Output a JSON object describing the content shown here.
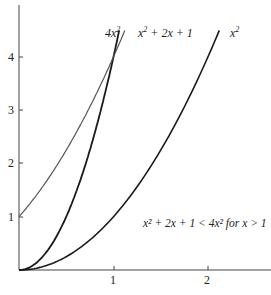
{
  "chart_data": {
    "type": "line",
    "title": "",
    "xlabel": "",
    "ylabel": "",
    "xlim": [
      0,
      2.65
    ],
    "ylim": [
      0,
      5
    ],
    "x_ticks": [
      1,
      2
    ],
    "y_ticks": [
      1,
      2,
      3,
      4
    ],
    "x_tick_labels": [
      "1",
      "2"
    ],
    "y_tick_labels": [
      "1",
      "2",
      "3",
      "4"
    ],
    "grid": false,
    "series": [
      {
        "name": "4x^2",
        "label": "4x²",
        "formula": "4*x^2",
        "x_range": [
          0,
          1.06
        ],
        "color": "#1a1a1a",
        "width": 1.8
      },
      {
        "name": "x^2+2x+1",
        "label": "x² + 2x + 1",
        "formula": "x^2+2x+1",
        "x_range": [
          0,
          1.12
        ],
        "color": "#555555",
        "width": 1.2
      },
      {
        "name": "x^2",
        "label": "x²",
        "formula": "x^2",
        "x_range": [
          0,
          2.12
        ],
        "color": "#1a1a1a",
        "width": 1.6
      }
    ],
    "annotations": [
      {
        "text": "x² + 2x + 1 < 4x² for x > 1",
        "x": 1.32,
        "y": 1.3
      }
    ]
  },
  "labels": {
    "curve_4x2": "4x",
    "curve_4x2_sup": "2",
    "curve_quad": "x",
    "curve_quad_sup": "2",
    "curve_quad_rest": " + 2x + 1",
    "curve_x2": "x",
    "curve_x2_sup": "2",
    "annotation": "x² + 2x + 1 < 4x² for x > 1",
    "xtick_1": "1",
    "xtick_2": "2",
    "ytick_1": "1",
    "ytick_2": "2",
    "ytick_3": "3",
    "ytick_4": "4"
  }
}
